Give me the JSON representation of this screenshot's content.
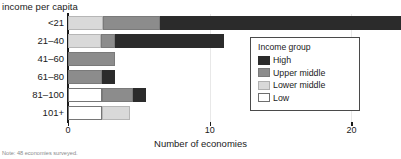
{
  "chart_data": {
    "type": "bar",
    "orientation": "horizontal",
    "stacked": true,
    "title": "income per capita",
    "xlabel": "Number of economies",
    "ylabel": "",
    "xlim": [
      0,
      23.5
    ],
    "grid": true,
    "legend_position": "inside-right",
    "legend_title": "Income group",
    "categories": [
      "<21",
      "21–40",
      "41–60",
      "61–80",
      "81–100",
      "101+"
    ],
    "series": [
      {
        "name": "Low",
        "color": "#ffffff",
        "values": [
          0,
          0,
          0,
          0,
          2.4,
          2.4
        ]
      },
      {
        "name": "Lower middle",
        "color": "#d9d9d9",
        "values": [
          2.5,
          2.3,
          0,
          0,
          0,
          2.0
        ]
      },
      {
        "name": "Upper middle",
        "color": "#8c8c8c",
        "values": [
          4.0,
          1.0,
          3.3,
          2.4,
          2.2,
          0
        ]
      },
      {
        "name": "High",
        "color": "#2b2b2b",
        "values": [
          17.0,
          7.7,
          0,
          0.9,
          0.9,
          0
        ]
      }
    ],
    "totals": [
      23.5,
      11.0,
      3.3,
      3.3,
      5.5,
      4.4
    ],
    "xticks": [
      0,
      10,
      20
    ],
    "xticklabels": [
      "0",
      "10",
      "20"
    ],
    "gridline_values": [
      10,
      20
    ],
    "footnote": "Note: 48 economies surveyed."
  },
  "legend": {
    "title": "Income group",
    "items": [
      {
        "label": "High",
        "key": "high"
      },
      {
        "label": "Upper middle",
        "key": "upper"
      },
      {
        "label": "Lower middle",
        "key": "lower"
      },
      {
        "label": "Low",
        "key": "low"
      }
    ]
  }
}
